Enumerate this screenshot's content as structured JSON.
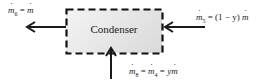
{
  "diagram": {
    "component": {
      "label": "Condenser"
    },
    "flows": [
      {
        "id": "left-outlet",
        "direction": "out",
        "side": "left",
        "subscript": "6",
        "rhs": "ṁ",
        "text": "ṁ6 = ṁ"
      },
      {
        "id": "right-inlet",
        "direction": "in",
        "side": "right",
        "subscript": "5",
        "rhs": "(1 − y) ṁ",
        "text": "ṁ5 = (1 − y) ṁ"
      },
      {
        "id": "bottom-inlet",
        "direction": "in",
        "side": "bottom",
        "subscript": "8",
        "mid_subscript": "4",
        "rhs": "y ṁ",
        "text": "ṁ8 = ṁ4 = y ṁ"
      }
    ]
  },
  "labels": {
    "left": {
      "m": "m",
      "sub": "6",
      "eq": " = ",
      "rhs_m": "m"
    },
    "right": {
      "m": "m",
      "sub": "5",
      "eq": " = ",
      "paren": "(1 − y)",
      "rhs_m": "m"
    },
    "bottom": {
      "m": "m",
      "sub": "8",
      "eq1": " = ",
      "m2": "m",
      "sub2": "4",
      "eq2": " = ",
      "y": "y",
      "rhs_m": "m"
    }
  },
  "colors": {
    "arrow": "#1a1a1a",
    "border": "#111111",
    "box_fill_light": "#f4f4f4",
    "box_fill_dark": "#d9d9d9"
  }
}
